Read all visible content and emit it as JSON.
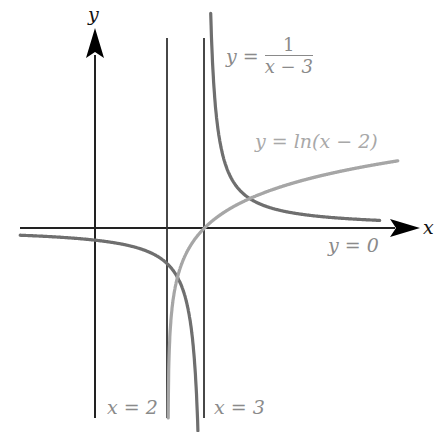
{
  "diagram": {
    "type": "function-graph",
    "axes": {
      "x_label": "x",
      "y_label": "y"
    },
    "curves": [
      {
        "name": "reciprocal",
        "equation_lhs": "y =",
        "numerator": "1",
        "denominator": "x − 3",
        "color": "#6f6f6f"
      },
      {
        "name": "log",
        "equation": "y = ln(x − 2)",
        "color": "#a6a6a6"
      }
    ],
    "asymptotes": [
      {
        "label": "x = 2"
      },
      {
        "label": "x = 3"
      },
      {
        "label": "y = 0"
      }
    ],
    "colors": {
      "axis": "#111111",
      "asymptote": "#333333",
      "label": "#8a8a8a"
    }
  },
  "chart_data": {
    "type": "line",
    "title": "",
    "xlabel": "x",
    "ylabel": "y",
    "series": [
      {
        "name": "y = 1/(x − 3)",
        "function": "1/(x-3)",
        "domain": "x ≠ 3",
        "vertical_asymptote": 3,
        "horizontal_asymptote": 0
      },
      {
        "name": "y = ln(x − 2)",
        "function": "ln(x-2)",
        "domain": "x > 2",
        "vertical_asymptote": 2,
        "x_intercept": 3
      }
    ],
    "annotations": [
      "x = 2",
      "x = 3",
      "y = 0",
      "y = 1/(x − 3)",
      "y = ln(x − 2)"
    ],
    "xlim": [
      -2,
      8.5
    ],
    "ylim": [
      -5.5,
      6.3
    ],
    "grid": false
  }
}
